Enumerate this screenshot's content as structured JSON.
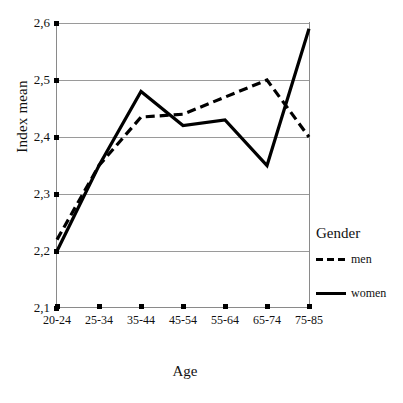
{
  "chart_data": {
    "type": "line",
    "title": "",
    "xlabel": "Age",
    "ylabel": "Index mean",
    "categories": [
      "20-24",
      "25-34",
      "35-44",
      "45-54",
      "55-64",
      "65-74",
      "75-85"
    ],
    "ylim": [
      2.1,
      2.6
    ],
    "yticks": [
      "2,1",
      "2,2",
      "2,3",
      "2,4",
      "2,5",
      "2,6"
    ],
    "ytick_values": [
      2.1,
      2.2,
      2.3,
      2.4,
      2.5,
      2.6
    ],
    "grid": true,
    "grid_axis": "y",
    "legend_position": "right",
    "legend_title": "Gender",
    "series": [
      {
        "name": "men",
        "style": "dashed",
        "color": "#000000",
        "values": [
          2.22,
          2.35,
          2.435,
          2.44,
          2.47,
          2.5,
          2.4
        ]
      },
      {
        "name": "women",
        "style": "solid",
        "color": "#000000",
        "values": [
          2.2,
          2.35,
          2.48,
          2.42,
          2.43,
          2.35,
          2.59
        ]
      }
    ]
  },
  "axes": {
    "y_title": "Index mean",
    "x_title": "Age"
  },
  "legend": {
    "title": "Gender",
    "items": [
      {
        "label": "men",
        "style": "dashed"
      },
      {
        "label": "women",
        "style": "solid"
      }
    ]
  },
  "colors": {
    "line": "#000000",
    "grid": "#9a9a9a",
    "axis": "#8a8a8a",
    "background": "#ffffff"
  }
}
